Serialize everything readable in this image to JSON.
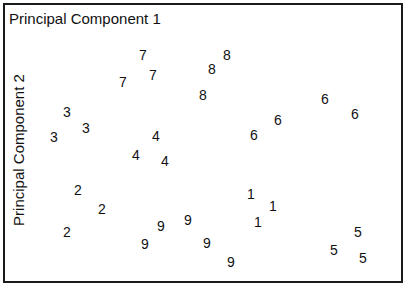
{
  "chart": {
    "title": "Principal Component 1",
    "ylabel": "Principal Component 2"
  },
  "chart_data": {
    "type": "scatter",
    "title": "Principal Component 1",
    "xlabel": "Principal Component 1",
    "ylabel": "Principal Component 2",
    "grid": false,
    "legend": null,
    "note": "Points are drawn as digit-class labels; coordinates are pixel positions within the 410x292 figure.",
    "points": [
      {
        "label": "7",
        "x": 143,
        "y": 55
      },
      {
        "label": "7",
        "x": 153,
        "y": 75
      },
      {
        "label": "7",
        "x": 123,
        "y": 82
      },
      {
        "label": "8",
        "x": 227,
        "y": 55
      },
      {
        "label": "8",
        "x": 212,
        "y": 69
      },
      {
        "label": "8",
        "x": 203,
        "y": 95
      },
      {
        "label": "6",
        "x": 325,
        "y": 99
      },
      {
        "label": "6",
        "x": 355,
        "y": 114
      },
      {
        "label": "6",
        "x": 278,
        "y": 120
      },
      {
        "label": "6",
        "x": 254,
        "y": 135
      },
      {
        "label": "3",
        "x": 67,
        "y": 112
      },
      {
        "label": "3",
        "x": 86,
        "y": 128
      },
      {
        "label": "3",
        "x": 54,
        "y": 137
      },
      {
        "label": "4",
        "x": 156,
        "y": 136
      },
      {
        "label": "4",
        "x": 136,
        "y": 155
      },
      {
        "label": "4",
        "x": 165,
        "y": 161
      },
      {
        "label": "2",
        "x": 78,
        "y": 190
      },
      {
        "label": "2",
        "x": 102,
        "y": 209
      },
      {
        "label": "2",
        "x": 67,
        "y": 232
      },
      {
        "label": "9",
        "x": 161,
        "y": 226
      },
      {
        "label": "9",
        "x": 188,
        "y": 220
      },
      {
        "label": "9",
        "x": 145,
        "y": 244
      },
      {
        "label": "9",
        "x": 207,
        "y": 243
      },
      {
        "label": "9",
        "x": 231,
        "y": 262
      },
      {
        "label": "1",
        "x": 251,
        "y": 194
      },
      {
        "label": "1",
        "x": 273,
        "y": 206
      },
      {
        "label": "1",
        "x": 258,
        "y": 222
      },
      {
        "label": "5",
        "x": 358,
        "y": 232
      },
      {
        "label": "5",
        "x": 334,
        "y": 250
      },
      {
        "label": "5",
        "x": 363,
        "y": 258
      }
    ]
  }
}
